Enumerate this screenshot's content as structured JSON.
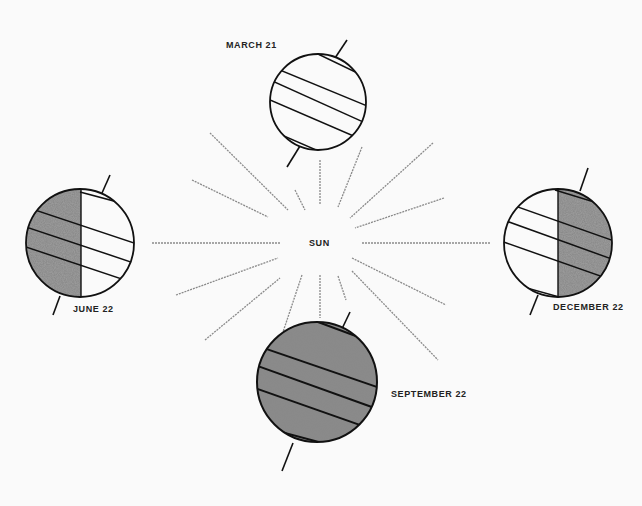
{
  "diagram": {
    "center_label": "SUN",
    "positions": [
      {
        "id": "march",
        "label": "MARCH 21",
        "lit": "full"
      },
      {
        "id": "june",
        "label": "JUNE 22",
        "lit": "right-half"
      },
      {
        "id": "december",
        "label": "DECEMBER 22",
        "lit": "left-half"
      },
      {
        "id": "september",
        "label": "SEPTEMBER 22",
        "lit": "none"
      }
    ]
  },
  "colors": {
    "line": "#111111",
    "shade": "#555555",
    "ray": "#8a8a8a",
    "background": "#fafafa"
  }
}
